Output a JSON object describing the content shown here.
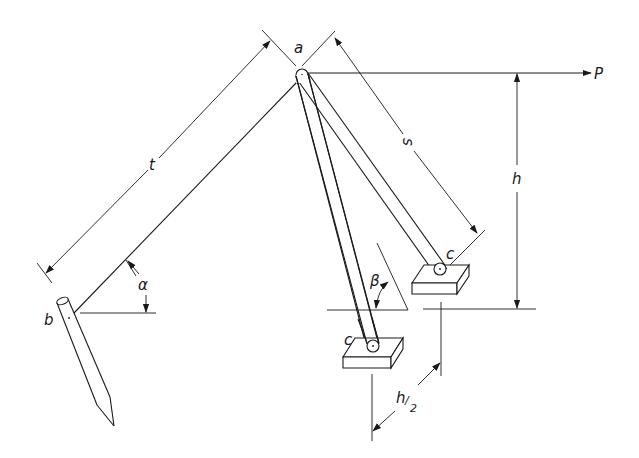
{
  "diagram": {
    "type": "mechanical-schematic",
    "colors": {
      "line": "#1a1a1a",
      "background": "#ffffff"
    },
    "labels": {
      "apex": "a",
      "stake": "b",
      "footing_left": "c",
      "footing_right": "c",
      "force": "P",
      "tie_length": "t",
      "leg_length": "s",
      "height": "h",
      "half_height_num": "h",
      "half_height_den": "2",
      "angle_tie": "α",
      "angle_leg": "β"
    },
    "dimensions": [
      {
        "name": "t",
        "from": "b",
        "to": "a",
        "meaning": "tie length"
      },
      {
        "name": "s",
        "from": "a",
        "to": "c",
        "meaning": "leg length"
      },
      {
        "name": "h",
        "meaning": "height of P above footing base"
      },
      {
        "name": "h/2",
        "meaning": "horizontal offset between footings"
      }
    ],
    "angles": [
      {
        "name": "α",
        "between": "tie b–a and horizontal"
      },
      {
        "name": "β",
        "between": "leg and horizontal"
      }
    ]
  }
}
